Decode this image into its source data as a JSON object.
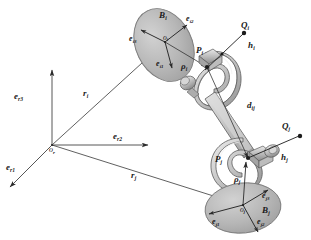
{
  "figure": {
    "domain": "diagram",
    "background_color": "#ffffff",
    "line_color": "#2b2b2b",
    "body_fill": "#b9b9b9",
    "body_stroke": "#555555",
    "rod_fill": "#c9c9c9",
    "rod_highlight": "#e6e6e6",
    "rod_shadow": "#8e8e8e",
    "width": 311,
    "height": 240
  },
  "global_frame": {
    "origin_label": "o",
    "origin_sub": "r",
    "axes": [
      {
        "label": "e",
        "sub": "r1",
        "name": "axis-er1",
        "direction": "down-left"
      },
      {
        "label": "e",
        "sub": "r2",
        "name": "axis-er2",
        "direction": "right"
      },
      {
        "label": "e",
        "sub": "r3",
        "name": "axis-er3",
        "direction": "up"
      }
    ]
  },
  "bodies": [
    {
      "id": "i",
      "body_label": "B",
      "body_sub": "i",
      "center_label": "o",
      "center_sub": "i",
      "position_vector": {
        "label": "r",
        "sub": "i"
      },
      "frame_axes": [
        {
          "label": "e",
          "sub": "i1",
          "direction": "down"
        },
        {
          "label": "e",
          "sub": "i2",
          "direction": "up-right"
        },
        {
          "label": "e",
          "sub": "i3",
          "direction": "up-left"
        }
      ],
      "joint_point": {
        "label": "P",
        "sub": "i"
      },
      "joint_vector": {
        "label": "ρ",
        "sub": "i"
      },
      "unit_vector": {
        "label": "h",
        "sub": "i"
      },
      "axis_point": {
        "label": "Q",
        "sub": "i"
      }
    },
    {
      "id": "j",
      "body_label": "B",
      "body_sub": "j",
      "center_label": "o",
      "center_sub": "j",
      "position_vector": {
        "label": "r",
        "sub": "j"
      },
      "frame_axes": [
        {
          "label": "e",
          "sub": "j1",
          "direction": "left"
        },
        {
          "label": "e",
          "sub": "j2",
          "direction": "down-right"
        },
        {
          "label": "e",
          "sub": "j3",
          "direction": "up-right"
        }
      ],
      "joint_point": {
        "label": "P",
        "sub": "j"
      },
      "joint_vector": {
        "label": "ρ",
        "sub": "j"
      },
      "unit_vector": {
        "label": "h",
        "sub": "j"
      },
      "axis_point": {
        "label": "Q",
        "sub": "j"
      }
    }
  ],
  "link": {
    "distance_vector": {
      "label": "d",
      "sub": "ij"
    },
    "description": "connecting rod between P_i and P_j"
  }
}
